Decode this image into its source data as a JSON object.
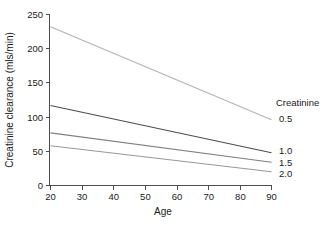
{
  "chart_data": {
    "type": "line",
    "title": "",
    "xlabel": "Age",
    "ylabel": "Creatinine clearance (mls/min)",
    "xlim": [
      20,
      90
    ],
    "ylim": [
      0,
      250
    ],
    "xticks": [
      20,
      30,
      40,
      50,
      60,
      70,
      80,
      90
    ],
    "yticks": [
      0,
      50,
      100,
      150,
      200,
      250
    ],
    "xtick_labels": [
      "20",
      "30",
      "40",
      "50",
      "60",
      "70",
      "80",
      "90"
    ],
    "ytick_labels": [
      "0",
      "50",
      "100",
      "150",
      "200",
      "250"
    ],
    "grid": false,
    "legend_position": "right",
    "legend_title": "Creatinine",
    "x": [
      20,
      90
    ],
    "series": [
      {
        "name": "0.5",
        "label": "0.5",
        "color": "#b3b3b3",
        "values": [
          232,
          96
        ]
      },
      {
        "name": "1.0",
        "label": "1.0",
        "color": "#4d4d4d",
        "values": [
          117,
          48
        ]
      },
      {
        "name": "1.5",
        "label": "1.5",
        "color": "#808080",
        "values": [
          77,
          34
        ]
      },
      {
        "name": "2.0",
        "label": "2.0",
        "color": "#999999",
        "values": [
          58,
          20
        ]
      }
    ]
  },
  "axes": {
    "x_title": "Age",
    "y_title": "Creatinine clearance (mls/min)",
    "x_tick_labels": [
      "20",
      "30",
      "40",
      "50",
      "60",
      "70",
      "80",
      "90"
    ],
    "y_tick_labels": [
      "0",
      "50",
      "100",
      "150",
      "200",
      "250"
    ]
  },
  "legend": {
    "heading": "Creatinine",
    "entries": [
      "0.5",
      "1.0",
      "1.5",
      "2.0"
    ]
  },
  "colors": {
    "axis": "#4d4d4d",
    "text": "#1a1a1a",
    "background": "#ffffff",
    "series_0_5": "#b3b3b3",
    "series_1_0": "#4d4d4d",
    "series_1_5": "#808080",
    "series_2_0": "#999999"
  }
}
